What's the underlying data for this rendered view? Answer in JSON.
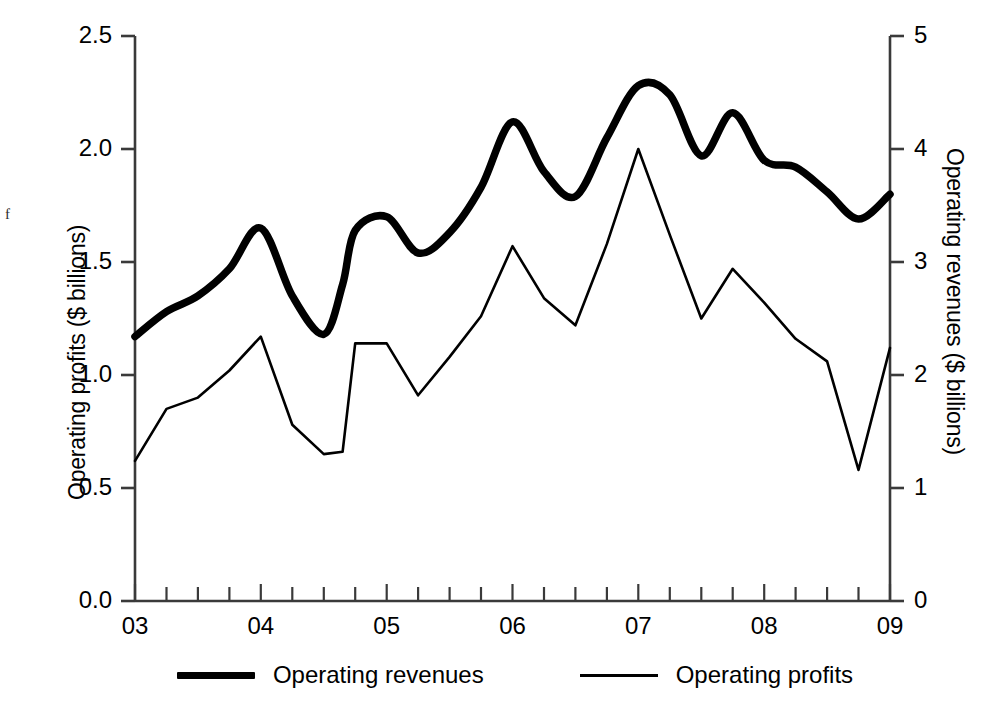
{
  "chart_data": {
    "type": "line",
    "title": "",
    "subtitle": "",
    "xlabel": "",
    "ylabel": "Operating profits ($ billions)",
    "ylabel_right": "Operating revenues ($ billions)",
    "grid": false,
    "legend_position": "below",
    "xlim": [
      2003.0,
      2009.0
    ],
    "ylim": [
      0.0,
      2.5
    ],
    "ylim_right": [
      0,
      5
    ],
    "x_tick_labels": [
      "03",
      "04",
      "05",
      "06",
      "07",
      "08",
      "09"
    ],
    "x_tick_values": [
      2003,
      2004,
      2005,
      2006,
      2007,
      2008,
      2009
    ],
    "x_minor_ticks_per_interval": 4,
    "y_tick_labels_left": [
      "0.0",
      "0.5",
      "1.0",
      "1.5",
      "2.0",
      "2.5"
    ],
    "y_tick_values_left": [
      0.0,
      0.5,
      1.0,
      1.5,
      2.0,
      2.5
    ],
    "y_tick_labels_right": [
      "0",
      "1",
      "2",
      "3",
      "4",
      "5"
    ],
    "y_tick_values_right": [
      0,
      1,
      2,
      3,
      4,
      5
    ],
    "x": [
      2003.0,
      2003.25,
      2003.5,
      2003.75,
      2004.0,
      2004.25,
      2004.5,
      2004.65,
      2004.75,
      2005.0,
      2005.25,
      2005.5,
      2005.75,
      2006.0,
      2006.25,
      2006.5,
      2006.75,
      2007.0,
      2007.25,
      2007.5,
      2007.75,
      2008.0,
      2008.25,
      2008.5,
      2008.75,
      2009.0
    ],
    "series": [
      {
        "name": "Operating revenues",
        "axis": "right",
        "line_width": "thick",
        "color": "#000000",
        "values": [
          2.34,
          2.56,
          2.7,
          2.94,
          3.3,
          2.7,
          2.36,
          2.8,
          3.28,
          3.4,
          3.08,
          3.26,
          3.66,
          4.24,
          3.8,
          3.58,
          4.1,
          4.56,
          4.48,
          3.94,
          4.32,
          3.9,
          3.84,
          3.62,
          3.38,
          3.6
        ]
      },
      {
        "name": "Operating profits",
        "axis": "left",
        "line_width": "thin",
        "color": "#000000",
        "values": [
          0.62,
          0.85,
          0.9,
          1.02,
          1.17,
          0.78,
          0.65,
          0.66,
          1.14,
          1.14,
          0.91,
          1.08,
          1.26,
          1.57,
          1.34,
          1.22,
          1.58,
          2.0,
          1.62,
          1.25,
          1.47,
          1.32,
          1.16,
          1.06,
          0.58,
          1.12
        ]
      }
    ],
    "annotations": [
      {
        "text": "f",
        "position": "far-left-margin"
      }
    ]
  },
  "legend": {
    "entries": [
      {
        "label": "Operating revenues",
        "style": "thick"
      },
      {
        "label": "Operating profits",
        "style": "thin"
      }
    ]
  },
  "colors": {
    "background": "#ffffff",
    "ink": "#000000",
    "axis": "#3a3a3a"
  }
}
